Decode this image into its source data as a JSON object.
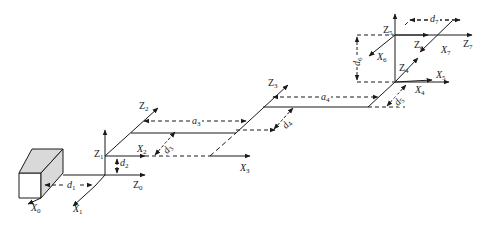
{
  "diagram": {
    "title": "",
    "type": "kinematic-frame-diagram",
    "colors": {
      "line": "#1a1a1a",
      "base_fill": "#d9d9d9",
      "background": "#ffffff"
    },
    "frames": [
      {
        "id": "Z0",
        "base": "Z",
        "sub": "0"
      },
      {
        "id": "X0",
        "base": "X",
        "sub": "0"
      },
      {
        "id": "X1",
        "base": "X",
        "sub": "1"
      },
      {
        "id": "Z1",
        "base": "Z",
        "sub": "1"
      },
      {
        "id": "X2",
        "base": "X",
        "sub": "2"
      },
      {
        "id": "Z2",
        "base": "Z",
        "sub": "2"
      },
      {
        "id": "X3",
        "base": "X",
        "sub": "3"
      },
      {
        "id": "Z3",
        "base": "Z",
        "sub": "3"
      },
      {
        "id": "Z4",
        "base": "Z",
        "sub": "4"
      },
      {
        "id": "X4",
        "base": "X",
        "sub": "4"
      },
      {
        "id": "X5",
        "base": "X",
        "sub": "5"
      },
      {
        "id": "Z5",
        "base": "Z",
        "sub": "5"
      },
      {
        "id": "X6",
        "base": "X",
        "sub": "6"
      },
      {
        "id": "Z6",
        "base": "Z",
        "sub": "6"
      },
      {
        "id": "X7",
        "base": "X",
        "sub": "7"
      },
      {
        "id": "Z7",
        "base": "Z",
        "sub": "7"
      }
    ],
    "dimensions": [
      {
        "id": "d1",
        "base": "d",
        "sub": "1"
      },
      {
        "id": "d2",
        "base": "d",
        "sub": "2"
      },
      {
        "id": "a3",
        "base": "a",
        "sub": "3"
      },
      {
        "id": "d3",
        "base": "d",
        "sub": "3"
      },
      {
        "id": "a4",
        "base": "a",
        "sub": "4"
      },
      {
        "id": "d4",
        "base": "d",
        "sub": "4"
      },
      {
        "id": "d5",
        "base": "d",
        "sub": "5"
      },
      {
        "id": "d6",
        "base": "d",
        "sub": "6"
      },
      {
        "id": "d7",
        "base": "d",
        "sub": "7"
      }
    ]
  }
}
